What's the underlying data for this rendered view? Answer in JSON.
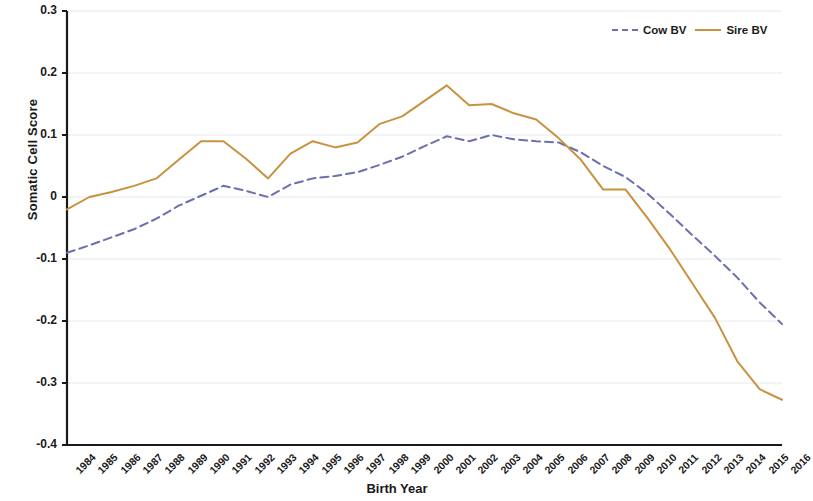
{
  "chart_data": {
    "type": "line",
    "title": "",
    "xlabel": "Birth Year",
    "ylabel": "Somatic Cell Score",
    "xlim": [
      1984,
      2016
    ],
    "ylim": [
      -0.4,
      0.3
    ],
    "grid": true,
    "legend_position": "top-right",
    "ytick_labels": [
      "0.3",
      "0.2",
      "0.1",
      "0",
      "-0.1",
      "-0.2",
      "-0.3",
      "-0.4"
    ],
    "ytick_values": [
      0.3,
      0.2,
      0.1,
      0,
      -0.1,
      -0.2,
      -0.3,
      -0.4
    ],
    "categories": [
      "1984",
      "1985",
      "1986",
      "1987",
      "1988",
      "1989",
      "1990",
      "1991",
      "1992",
      "1993",
      "1994",
      "1995",
      "1996",
      "1997",
      "1998",
      "1999",
      "2000",
      "2001",
      "2002",
      "2003",
      "2004",
      "2005",
      "2006",
      "2007",
      "2008",
      "2009",
      "2010",
      "2011",
      "2012",
      "2013",
      "2014",
      "2015",
      "2016"
    ],
    "x": [
      1984,
      1985,
      1986,
      1987,
      1988,
      1989,
      1990,
      1991,
      1992,
      1993,
      1994,
      1995,
      1996,
      1997,
      1998,
      1999,
      2000,
      2001,
      2002,
      2003,
      2004,
      2005,
      2006,
      2007,
      2008,
      2009,
      2010,
      2011,
      2012,
      2013,
      2014,
      2015,
      2016
    ],
    "series": [
      {
        "name": "Cow BV",
        "color": "#6b6fae",
        "style": "dashed",
        "values": [
          -0.09,
          -0.078,
          -0.065,
          -0.052,
          -0.035,
          -0.014,
          0.002,
          0.018,
          0.01,
          0.0,
          0.02,
          0.03,
          0.034,
          0.04,
          0.052,
          0.065,
          0.082,
          0.098,
          0.09,
          0.1,
          0.093,
          0.09,
          0.088,
          0.072,
          0.05,
          0.032,
          0.005,
          -0.028,
          -0.062,
          -0.095,
          -0.13,
          -0.17,
          -0.205
        ]
      },
      {
        "name": "Sire BV",
        "color": "#c8923f",
        "style": "solid",
        "values": [
          -0.02,
          0.0,
          0.008,
          0.018,
          0.03,
          0.06,
          0.09,
          0.09,
          0.062,
          0.03,
          0.07,
          0.09,
          0.08,
          0.088,
          0.118,
          0.13,
          0.155,
          0.18,
          0.148,
          0.15,
          0.135,
          0.125,
          0.095,
          0.06,
          0.012,
          0.012,
          -0.035,
          -0.085,
          -0.14,
          -0.195,
          -0.265,
          -0.31,
          -0.327
        ]
      }
    ]
  },
  "legend": {
    "entries": [
      {
        "label": "Cow BV"
      },
      {
        "label": "Sire BV"
      }
    ]
  }
}
